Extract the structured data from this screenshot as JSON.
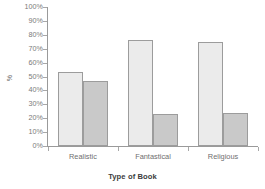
{
  "chart_data": {
    "type": "bar",
    "title": "",
    "xlabel": "Type of Book",
    "ylabel": "%",
    "categories": [
      "Realistic",
      "Fantastical",
      "Religious"
    ],
    "series": [
      {
        "name": "Series 1",
        "color": "#ebebeb",
        "values": [
          53,
          76,
          75
        ]
      },
      {
        "name": "Series 2",
        "color": "#c9c9c9",
        "values": [
          47,
          23,
          24
        ]
      }
    ],
    "ylim": [
      0,
      100
    ],
    "ytick_labels": [
      "0%",
      "10%",
      "20%",
      "30%",
      "40%",
      "50%",
      "60%",
      "70%",
      "80%",
      "90%",
      "100%"
    ],
    "ytick_values": [
      0,
      10,
      20,
      30,
      40,
      50,
      60,
      70,
      80,
      90,
      100
    ],
    "grid": false,
    "legend": false,
    "legend_position": "none",
    "axis_color": "#9a9a9a",
    "tick_label_color": "#7a7a7a",
    "bar_border_color": "#9c9c9c",
    "background": "#ffffff"
  }
}
